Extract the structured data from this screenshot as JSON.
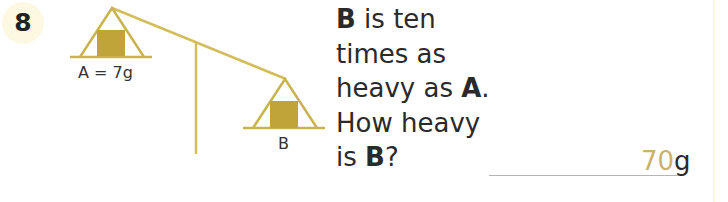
{
  "question": {
    "number": "8",
    "lines": [
      {
        "bold": "B",
        "text": " is ten"
      },
      {
        "bold": "",
        "text": "times as"
      },
      {
        "pre": "heavy as ",
        "bold": "A",
        "post": "."
      },
      {
        "bold": "",
        "text": "How heavy"
      },
      {
        "pre": "is ",
        "bold": "B",
        "post": "?"
      }
    ]
  },
  "diagram": {
    "label_a": "A = 7g",
    "label_b": "B",
    "colors": {
      "stroke": "#c9b34e",
      "fill": "#c0a437"
    }
  },
  "answer": {
    "value": "70",
    "unit": "g",
    "value_color": "#c8b36a"
  }
}
